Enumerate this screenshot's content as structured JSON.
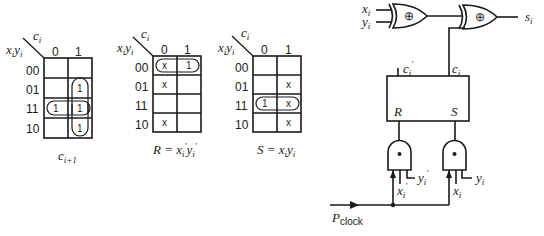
{
  "kmaps": [
    {
      "id": "carry",
      "col_var": "c",
      "col_var_sub": "i",
      "row_var": "x",
      "row_var_sub": "i",
      "row_var2": "y",
      "row_var2_sub": "i",
      "col_labels": [
        "0",
        "1"
      ],
      "row_labels": [
        "00",
        "01",
        "11",
        "10"
      ],
      "cells": [
        [
          "",
          ""
        ],
        [
          "",
          "1"
        ],
        [
          "1",
          "1"
        ],
        [
          "",
          "1"
        ]
      ],
      "caption": "c",
      "caption_sub": "i+1"
    },
    {
      "id": "reset",
      "col_var": "c",
      "col_var_sub": "i",
      "row_var": "x",
      "row_var_sub": "i",
      "row_var2": "y",
      "row_var2_sub": "i",
      "col_labels": [
        "0",
        "1"
      ],
      "row_labels": [
        "00",
        "01",
        "11",
        "10"
      ],
      "cells": [
        [
          "x",
          "1"
        ],
        [
          "x",
          ""
        ],
        [
          "",
          ""
        ],
        [
          "x",
          ""
        ]
      ],
      "caption": "R = x",
      "caption_sub": "i",
      "caption_prime": "′",
      "caption_mid": "y",
      "caption_sub2": "i",
      "caption_prime2": "′"
    },
    {
      "id": "set",
      "col_var": "c",
      "col_var_sub": "i",
      "row_var": "x",
      "row_var_sub": "i",
      "row_var2": "y",
      "row_var2_sub": "i",
      "col_labels": [
        "0",
        "1"
      ],
      "row_labels": [
        "00",
        "01",
        "11",
        "10"
      ],
      "cells": [
        [
          "",
          ""
        ],
        [
          "",
          "x"
        ],
        [
          "1",
          "x"
        ],
        [
          "",
          "x"
        ]
      ],
      "caption": "S = x",
      "caption_sub": "i",
      "caption_mid": "y",
      "caption_sub2": "i"
    }
  ],
  "circuit": {
    "inputs": {
      "x": "x",
      "x_sub": "i",
      "y": "y",
      "y_sub": "i"
    },
    "xor_symbol": "⊕",
    "and_symbol": "•",
    "output": {
      "s": "s",
      "s_sub": "i"
    },
    "flipflop": {
      "q_prime": "c",
      "q_prime_sub": "i",
      "q_prime_mark": "′",
      "q": "c",
      "q_sub": "i",
      "r": "R",
      "s": "S"
    },
    "and_r_inputs": {
      "x": "x",
      "x_sub": "i",
      "x_mark": "′",
      "y": "y",
      "y_sub": "i",
      "y_mark": "′"
    },
    "and_s_inputs": {
      "x": "x",
      "x_sub": "i",
      "y": "y",
      "y_sub": "i"
    },
    "clock": {
      "p": "P",
      "p_sub": "clock"
    }
  }
}
